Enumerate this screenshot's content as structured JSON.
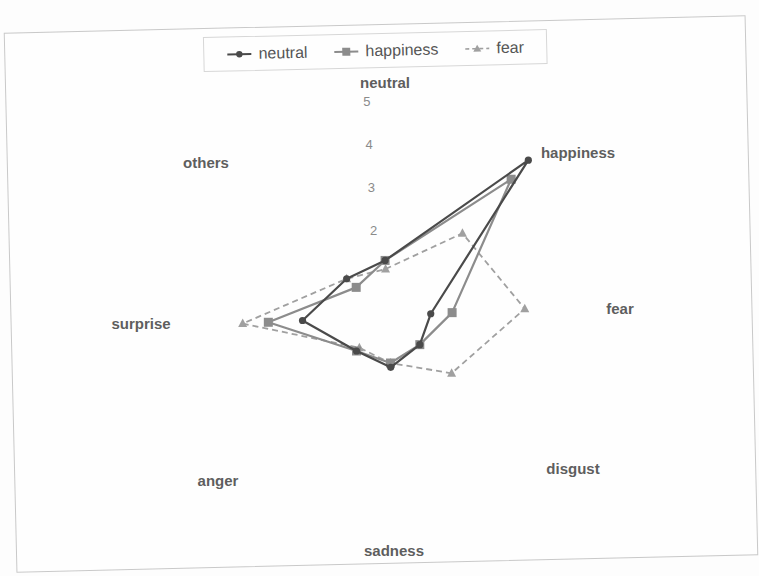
{
  "chart_data": {
    "type": "radar",
    "title": "",
    "categories": [
      "neutral",
      "happiness",
      "fear",
      "disgust",
      "sadness",
      "anger",
      "surprise",
      "others"
    ],
    "axis_ticks": [
      "1",
      "2",
      "3",
      "4",
      "5"
    ],
    "visible_tick_labels": [
      "2",
      "3",
      "4",
      "5"
    ],
    "range": [
      0,
      5
    ],
    "grid": false,
    "legend_position": "top",
    "series": [
      {
        "name": "neutral",
        "marker": "circle",
        "line": "solid",
        "color": "#4a4a4a",
        "values": [
          1.3,
          4.9,
          1.0,
          1.0,
          1.2,
          1.1,
          2.0,
          1.3
        ]
      },
      {
        "name": "happiness",
        "marker": "square",
        "line": "solid",
        "color": "#8c8c8c",
        "values": [
          1.3,
          4.3,
          1.5,
          1.0,
          1.1,
          1.1,
          2.8,
          1.0
        ]
      },
      {
        "name": "fear",
        "marker": "triangle",
        "line": "dashed",
        "color": "#a0a0a0",
        "values": [
          1.1,
          2.6,
          3.2,
          2.0,
          1.1,
          1.0,
          3.4,
          1.3
        ]
      }
    ]
  },
  "legend": {
    "items": [
      {
        "label": "neutral"
      },
      {
        "label": "happiness"
      },
      {
        "label": "fear"
      }
    ]
  }
}
